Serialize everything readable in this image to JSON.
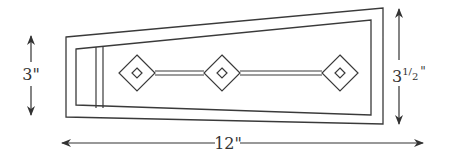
{
  "diagram": {
    "colors": {
      "line": "#3a3a3a",
      "background": "#ffffff"
    },
    "dimensions": {
      "left_height": {
        "label": "3\""
      },
      "right_height": {
        "label_whole": "3",
        "label_num": "1",
        "label_den": "2",
        "label_unit": "\""
      },
      "width": {
        "label": "12\""
      }
    },
    "elements": {
      "outer_frame": "tapered-outer-border",
      "inner_frame": "tapered-inner-border",
      "diamonds": [
        {
          "name": "diamond-left",
          "cx": 137,
          "cy": 73
        },
        {
          "name": "diamond-center",
          "cx": 222,
          "cy": 73
        },
        {
          "name": "diamond-right",
          "cx": 340,
          "cy": 73
        }
      ]
    }
  }
}
